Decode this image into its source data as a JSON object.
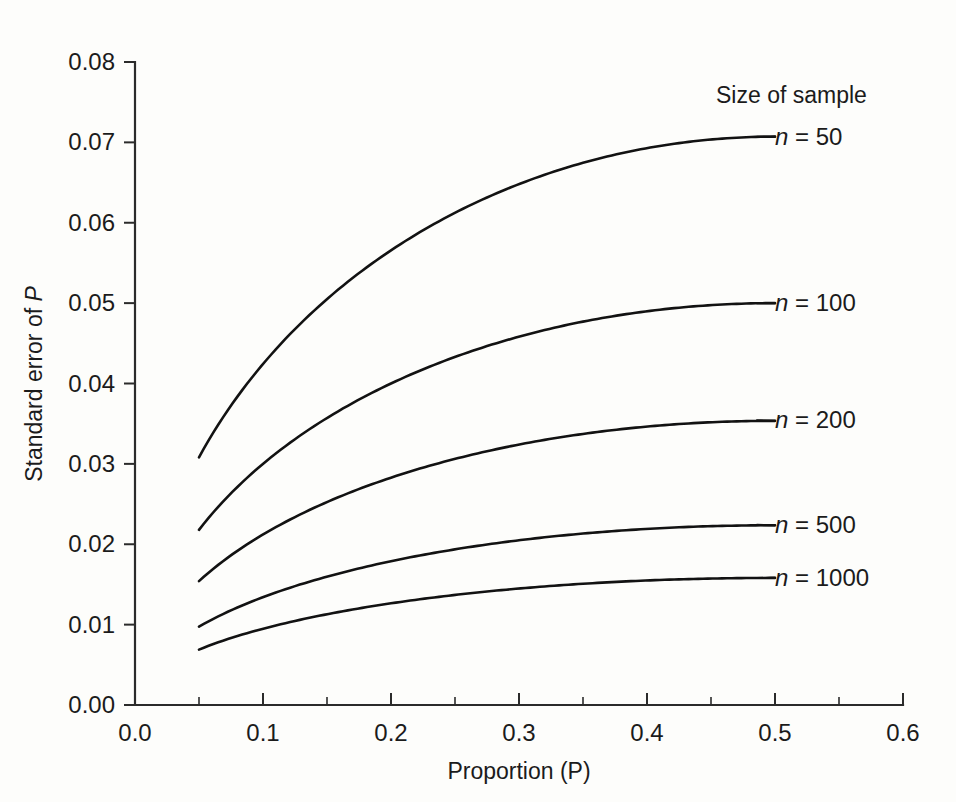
{
  "figure": {
    "background_color": "#fdfdfb",
    "line_color": "#121212",
    "axis_color": "#2b2b2b"
  },
  "axes": {
    "x_title": "Proportion (P)",
    "y_title_prefix": "Standard error of ",
    "y_title_symbol": "P",
    "x_ticklabels": [
      "0.0",
      "0.1",
      "0.2",
      "0.3",
      "0.4",
      "0.5",
      "0.6"
    ],
    "y_ticklabels": [
      "0.00",
      "0.01",
      "0.02",
      "0.03",
      "0.04",
      "0.05",
      "0.06",
      "0.07",
      "0.08"
    ]
  },
  "legend": {
    "title": "Size of sample",
    "entries": [
      {
        "prefix": "n",
        "equals": " = ",
        "value": "50"
      },
      {
        "prefix": "n",
        "equals": " = ",
        "value": "100"
      },
      {
        "prefix": "n",
        "equals": " = ",
        "value": "200"
      },
      {
        "prefix": "n",
        "equals": " = ",
        "value": "500"
      },
      {
        "prefix": "n",
        "equals": " = ",
        "value": "1000"
      }
    ]
  },
  "chart_data": {
    "type": "line",
    "title": "",
    "subtitle": "",
    "xlabel": "Proportion (P)",
    "ylabel": "Standard error of P",
    "xlim": [
      0.0,
      0.6
    ],
    "ylim": [
      0.0,
      0.08
    ],
    "xticks": [
      0.0,
      0.1,
      0.2,
      0.3,
      0.4,
      0.5,
      0.6
    ],
    "xticks_minor": [
      0.05,
      0.15,
      0.25,
      0.35,
      0.45,
      0.55
    ],
    "yticks": [
      0.0,
      0.01,
      0.02,
      0.03,
      0.04,
      0.05,
      0.06,
      0.07,
      0.08
    ],
    "grid": false,
    "legend_position": "right-inline-labels",
    "formula": "SE = sqrt(P*(1-P)/n)",
    "x": [
      0.05,
      0.1,
      0.15,
      0.2,
      0.25,
      0.3,
      0.35,
      0.4,
      0.45,
      0.5
    ],
    "series": [
      {
        "name": "n = 50",
        "n": 50,
        "values": [
          0.0308,
          0.0424,
          0.0505,
          0.0566,
          0.0612,
          0.0648,
          0.0675,
          0.0693,
          0.0704,
          0.0707
        ]
      },
      {
        "name": "n = 100",
        "n": 100,
        "values": [
          0.0218,
          0.03,
          0.0357,
          0.04,
          0.0433,
          0.0458,
          0.0477,
          0.049,
          0.0497,
          0.05
        ]
      },
      {
        "name": "n = 200",
        "n": 200,
        "values": [
          0.0154,
          0.0212,
          0.0252,
          0.0283,
          0.0306,
          0.0324,
          0.0337,
          0.0346,
          0.0352,
          0.0354
        ]
      },
      {
        "name": "n = 500",
        "n": 500,
        "values": [
          0.0097,
          0.0134,
          0.016,
          0.0179,
          0.0194,
          0.0205,
          0.0213,
          0.0219,
          0.0223,
          0.0224
        ]
      },
      {
        "name": "n = 1000",
        "n": 1000,
        "values": [
          0.0069,
          0.0095,
          0.0113,
          0.0126,
          0.0137,
          0.0145,
          0.0151,
          0.0155,
          0.0157,
          0.0158
        ]
      }
    ],
    "legend_title": "Size of sample",
    "annotations": [
      {
        "text": "n = 50",
        "at_x": 0.5,
        "at_y": 0.0707
      },
      {
        "text": "n = 100",
        "at_x": 0.5,
        "at_y": 0.05
      },
      {
        "text": "n = 200",
        "at_x": 0.5,
        "at_y": 0.0354
      },
      {
        "text": "n = 500",
        "at_x": 0.5,
        "at_y": 0.0224
      },
      {
        "text": "n = 1000",
        "at_x": 0.5,
        "at_y": 0.0158
      }
    ]
  }
}
